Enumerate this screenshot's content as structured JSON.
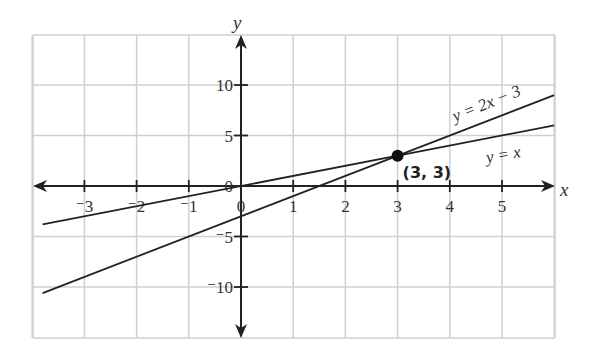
{
  "chart_data": {
    "type": "line",
    "title": "",
    "xlabel": "x",
    "ylabel": "y",
    "xlim": [
      -3.8,
      6
    ],
    "ylim": [
      -15,
      15
    ],
    "grid": true,
    "x_ticks": [
      -3,
      -2,
      -1,
      0,
      1,
      2,
      3,
      4,
      5
    ],
    "x_tick_labels": [
      "⁻3",
      "⁻2",
      "⁻1",
      "0",
      "1",
      "2",
      "3",
      "4",
      "5"
    ],
    "y_ticks": [
      -10,
      -5,
      0,
      5,
      10
    ],
    "y_tick_labels": [
      "⁻10",
      "⁻5",
      "0",
      "5",
      "10"
    ],
    "series": [
      {
        "name": "y = 2x − 3",
        "slope": 2,
        "intercept": -3,
        "x": [
          -3.8,
          6
        ],
        "y": [
          -10.6,
          9
        ]
      },
      {
        "name": "y =  x",
        "slope": 1,
        "intercept": 0,
        "x": [
          -3.8,
          6
        ],
        "y": [
          -3.8,
          6
        ]
      }
    ],
    "annotations": [
      {
        "type": "point",
        "x": 3,
        "y": 3,
        "label": "(3, 3)"
      },
      {
        "type": "text",
        "text": "y = 2x − 3",
        "x": 4.9,
        "y": 6
      },
      {
        "type": "text",
        "text": "y =  x",
        "x": 5.3,
        "y": 3
      }
    ]
  },
  "labels": {
    "x_axis": "x",
    "y_axis": "y",
    "line1": "y = 2x − 3",
    "line2": "y =  x",
    "point": "(3, 3)"
  }
}
